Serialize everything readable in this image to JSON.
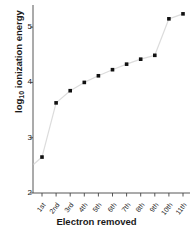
{
  "chart_data": {
    "type": "line",
    "title": "",
    "xlabel": "Electron removed",
    "ylabel_html": "log<sub>10</sub> ionization energy",
    "ylabel_text": "log10 ionization energy",
    "categories": [
      "1st",
      "2nd",
      "3rd",
      "4th",
      "5th",
      "6th",
      "7th",
      "8th",
      "9th",
      "10th",
      "11th"
    ],
    "values": [
      2.65,
      3.63,
      3.85,
      4.0,
      4.12,
      4.23,
      4.33,
      4.42,
      4.49,
      5.15,
      5.24
    ],
    "ylim": [
      2,
      5.4
    ],
    "yticks": [
      2,
      3,
      4,
      5
    ],
    "ytick_labels": [
      "2",
      "3",
      "4",
      "5"
    ],
    "grid": false,
    "legend": null,
    "marker": "square",
    "marker_color": "#111111",
    "line_color": "#dcdcdc",
    "axis_color": "#444444"
  }
}
